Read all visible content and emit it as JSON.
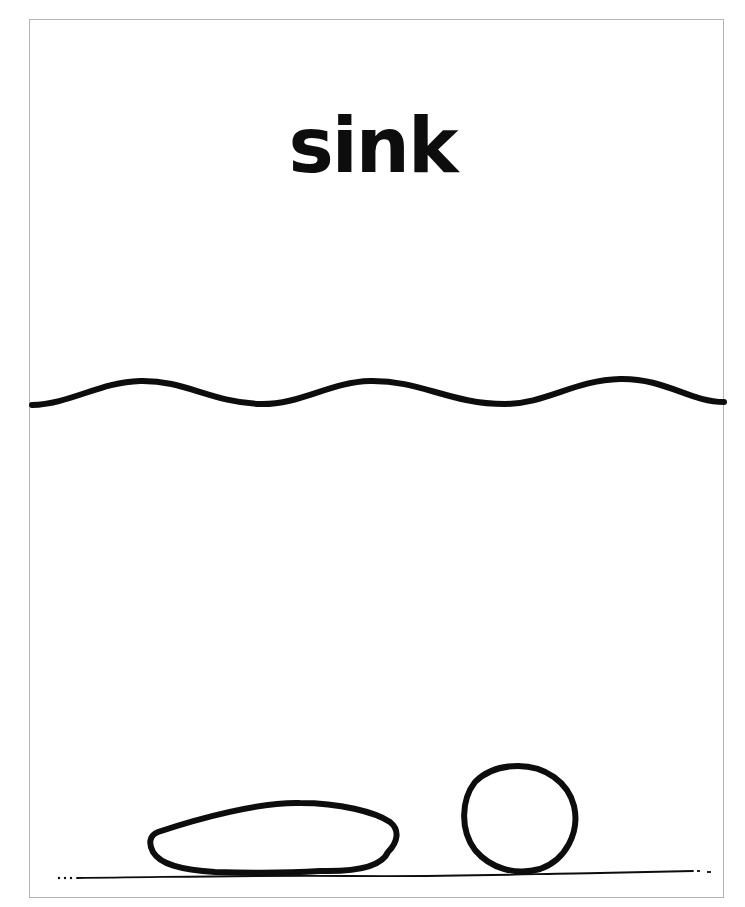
{
  "worksheet": {
    "title": "sink",
    "illustration": {
      "water_surface": "wavy-line",
      "objects": [
        "flat-stone",
        "round-ball"
      ],
      "ground": "bottom-line"
    }
  },
  "colors": {
    "ink": "#0d0d0d",
    "frame": "#b4b4b4",
    "paper": "#ffffff"
  }
}
